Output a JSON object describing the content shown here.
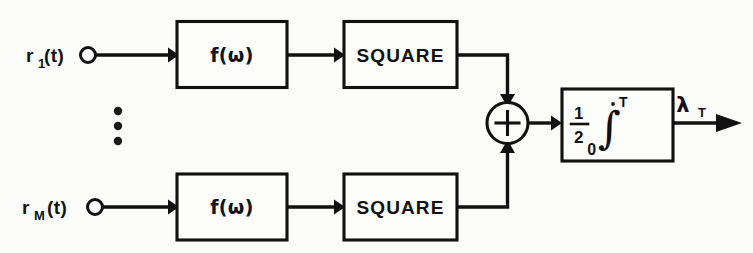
{
  "figure": {
    "background_color": "#fbfbfa",
    "line_color": "#111111"
  },
  "inputs": [
    {
      "id": "input-1",
      "label_base": "r",
      "label_subscript": "1",
      "label_tail": "(t)",
      "terminal": "open-circle"
    },
    {
      "id": "input-m",
      "label_base": "r",
      "label_subscript": "M",
      "label_tail": "(t)",
      "terminal": "open-circle"
    }
  ],
  "branches": [
    {
      "id": "branch-top",
      "filter_label": "f(ω)",
      "square_label": "SQUARE"
    },
    {
      "id": "branch-bottom",
      "filter_label": "f(ω)",
      "square_label": "SQUARE"
    }
  ],
  "ellipsis": {
    "symbol": "⋮",
    "dot_count": 3
  },
  "summer": {
    "symbol": "+",
    "name": "summing-junction"
  },
  "integrator": {
    "coefficient_numerator": "1",
    "coefficient_denominator": "2",
    "integral_symbol": "∫",
    "upper_limit": "T",
    "lower_limit": "0"
  },
  "output": {
    "label_base": "λ",
    "label_subscript": "T"
  }
}
